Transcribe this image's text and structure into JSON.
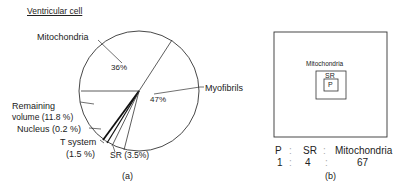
{
  "title": "Ventricular cell",
  "panel_a": {
    "caption": "(a)",
    "slices": [
      {
        "name": "Myofibrils",
        "label": "Myofibrils",
        "pct_label": "47%",
        "value": 47
      },
      {
        "name": "Mitochondria",
        "label": "Mitochondria",
        "pct_label": "36%",
        "value": 36
      },
      {
        "name": "Remaining volume",
        "label_line1": "Remaining",
        "label_line2": "volume (11.8 %)",
        "value": 11.8
      },
      {
        "name": "Nucleus",
        "label": "Nucleus (0.2 %)",
        "value": 0.2
      },
      {
        "name": "T system",
        "label_line1": "T system",
        "label_line2": "(1.5 %)",
        "value": 1.5
      },
      {
        "name": "SR",
        "label": "SR (3.5%)",
        "value": 3.5
      }
    ]
  },
  "panel_b": {
    "caption": "(b)",
    "outer_label": "Mitochondria",
    "middle_label": "SR",
    "inner_label": "P",
    "ratio_header": [
      "P",
      ":",
      "SR",
      ":",
      "Mitochondria"
    ],
    "ratio_values": [
      "1",
      ":",
      "4",
      ":",
      "67"
    ]
  }
}
